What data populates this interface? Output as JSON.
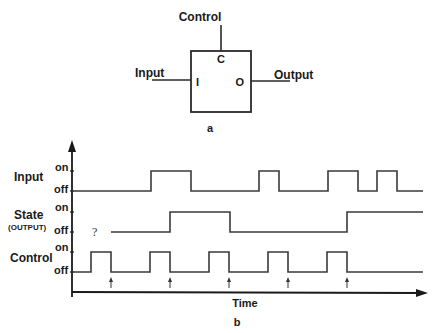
{
  "part_a": {
    "caption": "a",
    "block": {
      "control_label": "Control",
      "input_label": "Input",
      "output_label": "Output",
      "port_c": "C",
      "port_i": "I",
      "port_o": "O"
    }
  },
  "part_b": {
    "caption": "b",
    "x_axis_label": "Time",
    "unknown_marker": "?",
    "signals": [
      {
        "name": "Input",
        "sub": "",
        "on_label": "on",
        "off_label": "off"
      },
      {
        "name": "State",
        "sub": "(OUTPUT)",
        "on_label": "on",
        "off_label": "off"
      },
      {
        "name": "Control",
        "sub": "",
        "on_label": "on",
        "off_label": "off"
      }
    ],
    "waveforms": {
      "input_pulses": [
        [
          151,
          191
        ],
        [
          259,
          279
        ],
        [
          328,
          358
        ],
        [
          377,
          397
        ]
      ],
      "state_segments": "starts unknown, on from 170 to 230, on from 347 onward",
      "control_pulses": [
        [
          91,
          111
        ],
        [
          150,
          170
        ],
        [
          209,
          229
        ],
        [
          268,
          288
        ],
        [
          327,
          347
        ]
      ],
      "sample_arrows_x": [
        111,
        170,
        229,
        288,
        347
      ]
    }
  }
}
